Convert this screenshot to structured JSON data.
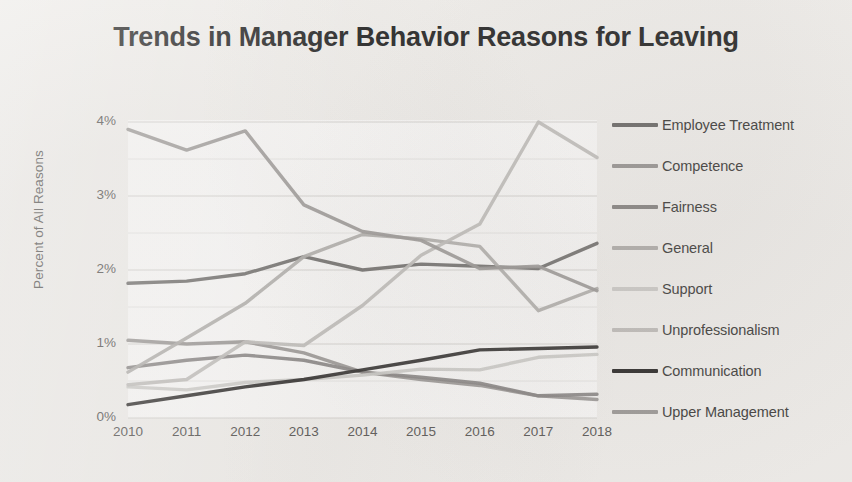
{
  "chart_data": {
    "type": "line",
    "title": "Trends in Manager Behavior Reasons for Leaving",
    "xlabel": "",
    "ylabel": "Percent of All Reasons",
    "x": [
      2010,
      2011,
      2012,
      2013,
      2014,
      2015,
      2016,
      2017,
      2018
    ],
    "categories": [
      "2010",
      "2011",
      "2012",
      "2013",
      "2014",
      "2015",
      "2016",
      "2017",
      "2018"
    ],
    "xtick_labels": [
      "2010",
      "2011",
      "2012",
      "2013",
      "2014",
      "2015",
      "2016",
      "2017",
      "2018"
    ],
    "ytick_labels": [
      "0%",
      "1%",
      "2%",
      "3%",
      "4%"
    ],
    "ytick_values": [
      0,
      1,
      2,
      3,
      4
    ],
    "ylim": [
      0,
      4
    ],
    "xlim": [
      2010,
      2018
    ],
    "grid": "horizontal-major-and-minor",
    "minor_gridline_step": 0.5,
    "legend_position": "right",
    "series": [
      {
        "name": "Employee Treatment",
        "color": "#6f6d6b",
        "values": [
          1.82,
          1.85,
          1.95,
          2.18,
          2.0,
          2.08,
          2.05,
          2.02,
          2.36
        ]
      },
      {
        "name": "Competence",
        "color": "#9b9896",
        "values": [
          1.05,
          1.0,
          1.03,
          0.88,
          0.62,
          0.52,
          0.44,
          0.3,
          0.25
        ]
      },
      {
        "name": "Fairness",
        "color": "#8a8785",
        "values": [
          0.68,
          0.78,
          0.85,
          0.78,
          0.62,
          0.55,
          0.47,
          0.3,
          0.32
        ]
      },
      {
        "name": "General",
        "color": "#b3b0ad",
        "values": [
          0.62,
          1.08,
          1.55,
          2.18,
          2.48,
          2.42,
          2.32,
          1.45,
          1.75
        ]
      },
      {
        "name": "Support",
        "color": "#cfcdca",
        "values": [
          0.42,
          0.38,
          0.48,
          0.52,
          0.58,
          0.66,
          0.65,
          0.82,
          0.86
        ]
      },
      {
        "name": "Unprofessionalism",
        "color": "#c2bfbc",
        "values": [
          0.45,
          0.52,
          1.03,
          0.98,
          1.52,
          2.2,
          2.62,
          4.0,
          3.52
        ]
      },
      {
        "name": "Communication",
        "color": "#2e2c2b",
        "values": [
          0.18,
          0.3,
          0.42,
          0.52,
          0.65,
          0.78,
          0.92,
          0.94,
          0.96
        ]
      },
      {
        "name": "Upper Management",
        "color": "#9e9b99",
        "values": [
          3.9,
          3.62,
          3.88,
          2.88,
          2.52,
          2.4,
          2.02,
          2.05,
          1.72
        ]
      }
    ]
  },
  "legend": {
    "items": [
      {
        "label": "Employee Treatment",
        "color": "#6f6d6b"
      },
      {
        "label": "Competence",
        "color": "#9b9896"
      },
      {
        "label": "Fairness",
        "color": "#8a8785"
      },
      {
        "label": "General",
        "color": "#b3b0ad"
      },
      {
        "label": "Support",
        "color": "#cfcdca"
      },
      {
        "label": "Unprofessionalism",
        "color": "#c2bfbc"
      },
      {
        "label": "Communication",
        "color": "#2e2c2b"
      },
      {
        "label": "Upper Management",
        "color": "#9e9b99"
      }
    ]
  },
  "colors": {
    "background": "#f2f0ed",
    "plot_background": "#fbfaf9",
    "title_text": "#2b2b2b",
    "tick_text": "#5a5856",
    "gridline": "#d8d6d3"
  }
}
